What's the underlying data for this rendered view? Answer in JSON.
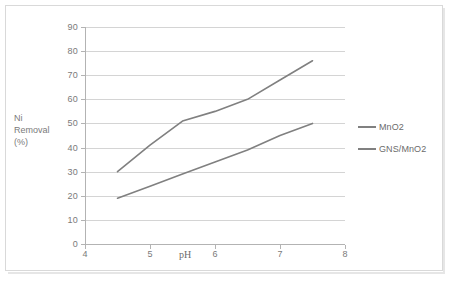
{
  "chart_data": {
    "type": "line",
    "title": "",
    "xlabel": "pH",
    "ylabel": "Ni Removal (%)",
    "ylabel_lines": [
      "Ni",
      "Removal",
      "(%)"
    ],
    "xlim": [
      4,
      8
    ],
    "ylim": [
      0,
      90
    ],
    "xticks": [
      4,
      5,
      6,
      7,
      8
    ],
    "yticks": [
      0,
      10,
      20,
      30,
      40,
      50,
      60,
      70,
      80,
      90
    ],
    "xtick_labels": [
      "4",
      "5",
      "6",
      "7",
      "8"
    ],
    "ytick_labels": [
      "0",
      "10",
      "20",
      "30",
      "40",
      "50",
      "60",
      "70",
      "80",
      "90"
    ],
    "grid": {
      "horizontal": true,
      "vertical": false
    },
    "legend_position": "right",
    "x": [
      4.5,
      5.0,
      5.5,
      6.0,
      6.5,
      7.0,
      7.5
    ],
    "series": [
      {
        "name": "MnO2",
        "color": "#808080",
        "values": [
          30,
          41,
          51,
          55,
          60,
          68,
          76
        ]
      },
      {
        "name": "GNS/MnO2",
        "color": "#808080",
        "values": [
          19,
          24,
          29,
          34,
          39,
          45,
          50
        ]
      }
    ]
  },
  "axes": {
    "y_title_lines": [
      "Ni",
      "Removal",
      "(%)"
    ],
    "x_title": "pH"
  },
  "legend": {
    "items": [
      {
        "label": "MnO2",
        "color": "#808080"
      },
      {
        "label": "GNS/MnO2",
        "color": "#808080"
      }
    ]
  },
  "colors": {
    "series_line": "#808080",
    "gridline": "#d4d4d4",
    "axis_line": "#b3b3b3",
    "text": "#7a7a7a",
    "frame_border": "#d9d9d9",
    "background": "#ffffff"
  }
}
